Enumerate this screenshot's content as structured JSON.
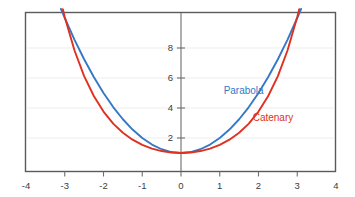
{
  "figure": {
    "background_color": "#ffffff",
    "frame_color": "#5a5a5a",
    "grid_color": "#ededed",
    "axis_color": "#6e6e6e",
    "tick_text_color": "#3c3c3c"
  },
  "chart_data": {
    "type": "line",
    "title": "",
    "xlabel": "",
    "ylabel": "",
    "xlim": [
      -4,
      4
    ],
    "ylim": [
      0,
      10.4
    ],
    "grid": true,
    "grid_axis": "y",
    "legend": "inline-annotations",
    "x_ticks": [
      -4,
      -3,
      -2,
      -1,
      0,
      1,
      2,
      3,
      4
    ],
    "x_tick_labels": [
      "-4",
      "-3",
      "-2",
      "-1",
      "0",
      "1",
      "2",
      "3",
      "4"
    ],
    "y_ticks": [
      2,
      4,
      6,
      8
    ],
    "y_tick_labels": [
      "2",
      "4",
      "6",
      "8"
    ],
    "series": [
      {
        "name": "Parabola",
        "color": "#3478c8",
        "formula": "y = x^2 + 1",
        "x": [
          -3.1,
          -3.0,
          -2.75,
          -2.5,
          -2.25,
          -2.0,
          -1.75,
          -1.5,
          -1.25,
          -1.0,
          -0.75,
          -0.5,
          -0.25,
          0,
          0.25,
          0.5,
          0.75,
          1.0,
          1.25,
          1.5,
          1.75,
          2.0,
          2.25,
          2.5,
          2.75,
          3.0,
          3.1
        ],
        "values": [
          10.61,
          10.0,
          8.5625,
          7.25,
          6.0625,
          5.0,
          4.0625,
          3.25,
          2.5625,
          2.0,
          1.5625,
          1.25,
          1.0625,
          1.0,
          1.0625,
          1.25,
          1.5625,
          2.0,
          2.5625,
          3.25,
          4.0625,
          5.0,
          6.0625,
          7.25,
          8.5625,
          10.0,
          10.61
        ]
      },
      {
        "name": "Catenary",
        "color": "#e03020",
        "formula": "y = cosh(x)",
        "x": [
          -3.05,
          -3.0,
          -2.75,
          -2.5,
          -2.25,
          -2.0,
          -1.75,
          -1.5,
          -1.25,
          -1.0,
          -0.75,
          -0.5,
          -0.25,
          0,
          0.25,
          0.5,
          0.75,
          1.0,
          1.25,
          1.5,
          1.75,
          2.0,
          2.25,
          2.5,
          2.75,
          3.0,
          3.05
        ],
        "values": [
          10.59,
          10.07,
          7.85,
          6.13,
          4.8,
          3.76,
          2.96,
          2.35,
          1.89,
          1.54,
          1.29,
          1.13,
          1.03,
          1.0,
          1.03,
          1.13,
          1.29,
          1.54,
          1.89,
          2.35,
          2.96,
          3.76,
          4.8,
          6.13,
          7.85,
          10.07,
          10.59
        ]
      }
    ],
    "annotations": [
      {
        "text": "Parabola",
        "color": "#3478c8",
        "x": 1.1,
        "y": 5.1
      },
      {
        "text": "Catenary",
        "color": "#e03020",
        "x": 1.85,
        "y": 3.3
      }
    ]
  }
}
